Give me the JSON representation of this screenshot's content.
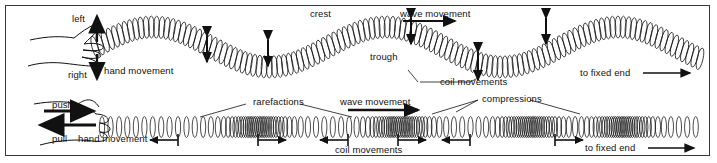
{
  "figure": {
    "border_color": "#3a3a3a",
    "ink_color": "#111111",
    "background": "#ffffff"
  },
  "transverse": {
    "name": "transverse wave panel",
    "labels": {
      "left": "left",
      "right": "right",
      "hand_movement": "hand movement",
      "crest": "crest",
      "trough": "trough",
      "wave_movement": "wave movement",
      "coil_movements": "coil movements",
      "to_fixed_end": "to fixed end"
    },
    "wave": {
      "baseline_y": 47,
      "amplitude": 20,
      "start_x": 95,
      "end_x": 700,
      "cycles": 2.6
    },
    "coil_arrows_x": [
      207,
      268,
      411,
      478,
      546
    ],
    "hand_arrow_up_label": "left",
    "hand_arrow_down_label": "right"
  },
  "longitudinal": {
    "name": "longitudinal wave panel",
    "labels": {
      "push": "push",
      "pull": "pull",
      "hand_movement": "hand movement",
      "rarefactions": "rarefactions",
      "compressions": "compressions",
      "wave_movement": "wave movement",
      "coil_movements_left": "coil movements",
      "coil_movements_right": "coil movements",
      "to_fixed_end": "to fixed end"
    },
    "axis_y": 127,
    "start_x": 98,
    "end_x": 700,
    "compression_centers": [
      258,
      400,
      530,
      622
    ],
    "rarefaction_centers": [
      200,
      330,
      470,
      580
    ],
    "coil_arrows": [
      {
        "x": 148,
        "dir": "left"
      },
      {
        "x": 228,
        "dir": "right"
      },
      {
        "x": 300,
        "dir": "left"
      },
      {
        "x": 350,
        "dir": "right"
      },
      {
        "x": 420,
        "dir": "left"
      },
      {
        "x": 500,
        "dir": "right"
      }
    ]
  }
}
